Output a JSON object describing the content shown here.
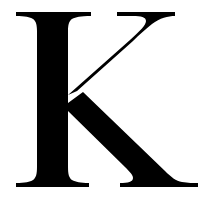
{
  "letter": {
    "character": "K",
    "description": "Large black serif capital letter K",
    "color": "#000000",
    "background": "#ffffff"
  }
}
